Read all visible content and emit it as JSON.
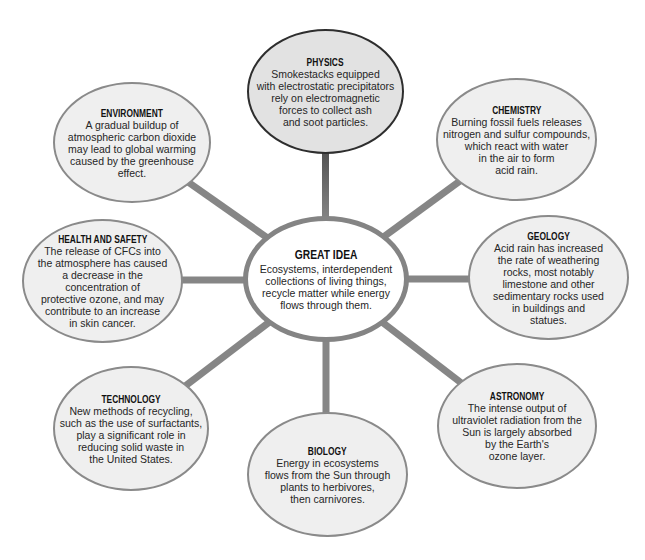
{
  "diagram": {
    "type": "concept-web",
    "colors": {
      "background": "#ffffff",
      "outer_fill": "#efefef",
      "outer_border": "#8a8a8a",
      "physics_fill": "#e2e2e2",
      "physics_border": "#2e2e2e",
      "center_fill": "#ffffff",
      "center_border": "#848484",
      "connector": "#868686",
      "physics_connector_top": "#4a4a4a"
    },
    "center": {
      "title": "GREAT IDEA",
      "lines": [
        "Ecosystems, interdependent",
        "collections of living things,",
        "recycle matter while energy",
        "flows through them."
      ]
    },
    "nodes": [
      {
        "id": "physics",
        "title": "PHYSICS",
        "lines": [
          "Smokestacks equipped",
          "with electrostatic precipitators",
          "rely on electromagnetic",
          "forces to collect ash",
          "and soot particles."
        ]
      },
      {
        "id": "environment",
        "title": "ENVIRONMENT",
        "lines": [
          "A gradual buildup of",
          "atmospheric carbon dioxide",
          "may lead to global warming",
          "caused by the greenhouse",
          "effect."
        ]
      },
      {
        "id": "chemistry",
        "title": "CHEMISTRY",
        "lines": [
          "Burning fossil fuels releases",
          "nitrogen and sulfur compounds,",
          "which react with water",
          "in the air to form",
          "acid rain."
        ]
      },
      {
        "id": "health-and-safety",
        "title": "HEALTH AND SAFETY",
        "lines": [
          "The release of CFCs into",
          "the atmosphere has caused",
          "a decrease in the",
          "concentration of",
          "protective ozone, and may",
          "contribute to an increase",
          "in skin cancer."
        ]
      },
      {
        "id": "geology",
        "title": "GEOLOGY",
        "lines": [
          "Acid rain has increased",
          "the rate of weathering",
          "rocks, most notably",
          "limestone and other",
          "sedimentary rocks used",
          "in buildings and",
          "statues."
        ]
      },
      {
        "id": "technology",
        "title": "TECHNOLOGY",
        "lines": [
          "New methods of recycling,",
          "such as the use of surfactants,",
          "play a significant role in",
          "reducing solid waste in",
          "the United States."
        ]
      },
      {
        "id": "biology",
        "title": "BIOLOGY",
        "lines": [
          "Energy in ecosystems",
          "flows from the Sun through",
          "plants to herbivores,",
          "then carnivores."
        ]
      },
      {
        "id": "astronomy",
        "title": "ASTRONOMY",
        "lines": [
          "The intense output of",
          "ultraviolet radiation from the",
          "Sun is largely absorbed",
          "by the Earth's",
          "ozone layer."
        ]
      }
    ]
  }
}
